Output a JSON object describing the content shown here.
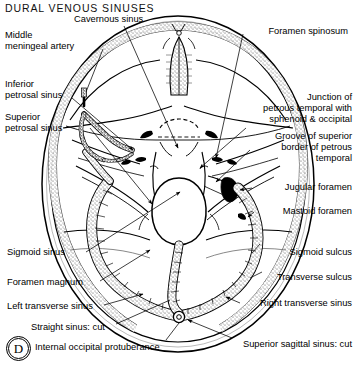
{
  "figure": {
    "title": "DURAL VENOUS SINUSES",
    "panel_letter": "D",
    "view": "superior view of interior of cranial base",
    "ink_color": "#000000",
    "background_color": "#ffffff"
  },
  "labels_left": [
    {
      "id": "cavernous-sinus",
      "text_lines": [
        "Cavernous sinus"
      ],
      "x": 74,
      "y": 18,
      "indent": false
    },
    {
      "id": "middle-meningeal-artery",
      "text_lines": [
        "Middle",
        "meningeal artery"
      ],
      "x": 5,
      "y": 32,
      "indent": true
    },
    {
      "id": "inferior-petrosal-sinus",
      "text_lines": [
        "Inferior",
        "petrosal sinus"
      ],
      "x": 5,
      "y": 81,
      "indent": false
    },
    {
      "id": "superior-petrosal-sinus",
      "text_lines": [
        "Superior",
        "petrosal sinus"
      ],
      "x": 5,
      "y": 114,
      "indent": false
    },
    {
      "id": "sigmoid-sinus",
      "text_lines": [
        "Sigmoid sinus"
      ],
      "x": 7,
      "y": 249,
      "indent": false
    },
    {
      "id": "foramen-magnum",
      "text_lines": [
        "Foramen magnum"
      ],
      "x": 7,
      "y": 279,
      "indent": false
    },
    {
      "id": "left-transverse-sinus",
      "text_lines": [
        "Left transverse sinus"
      ],
      "x": 7,
      "y": 303,
      "indent": false
    },
    {
      "id": "straight-sinus-cut",
      "text_lines": [
        "Straight sinus: cut"
      ],
      "x": 31,
      "y": 324,
      "indent": false
    },
    {
      "id": "internal-occipital-protuberance",
      "text_lines": [
        "Internal occipital protuberance"
      ],
      "x": 35,
      "y": 344,
      "indent": false
    }
  ],
  "labels_right": [
    {
      "id": "foramen-spinosum",
      "text_lines": [
        "Foramen spinosum"
      ],
      "right": 9,
      "y": 28
    },
    {
      "id": "junction-petrous-temporal",
      "text_lines": [
        "Junction of",
        "petrous temporal with",
        "sphenoid & occipital"
      ],
      "right": 5,
      "y": 94
    },
    {
      "id": "groove-superior-border-petrous",
      "text_lines": [
        "Groove of superior",
        "border of petrous",
        "temporal"
      ],
      "right": 5,
      "y": 133
    },
    {
      "id": "jugular-foramen",
      "text_lines": [
        "Jugular foramen"
      ],
      "right": 5,
      "y": 184
    },
    {
      "id": "mastoid-foramen",
      "text_lines": [
        "Mastoid foramen"
      ],
      "right": 5,
      "y": 208
    },
    {
      "id": "sigmoid-sulcus",
      "text_lines": [
        "Sigmoid sulcus"
      ],
      "right": 5,
      "y": 249
    },
    {
      "id": "transverse-sulcus",
      "text_lines": [
        "Transverse sulcus"
      ],
      "right": 5,
      "y": 274
    },
    {
      "id": "right-transverse-sinus",
      "text_lines": [
        "Right transverse sinus"
      ],
      "right": 5,
      "y": 300
    },
    {
      "id": "superior-sagittal-sinus-cut",
      "text_lines": [
        "Superior sagittal sinus: cut"
      ],
      "right": 5,
      "y": 341
    }
  ]
}
